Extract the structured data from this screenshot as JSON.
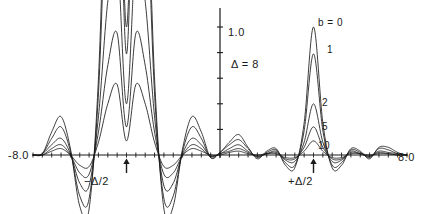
{
  "figure": {
    "background": "#ffffff",
    "line_color": "#1a1a1a",
    "axis_color": "#1a1a1a"
  },
  "annotations": {
    "delta_label": "Δ = 8",
    "neg_half_label": "−Δ/2",
    "pos_half_label": "+Δ/2",
    "y_tick_label": "1.0",
    "x_min_label": "-8.0",
    "x_max_label": "8.0"
  },
  "curve_labels": {
    "b0": "b = 0",
    "b1": "1",
    "b2": "2",
    "b5": "5",
    "b10": "10"
  },
  "chart_data": {
    "type": "line",
    "title": "",
    "subtitle": "",
    "xlabel": "",
    "ylabel": "",
    "xlim": [
      -8.0,
      8.0
    ],
    "ylim": [
      -0.45,
      1.25
    ],
    "grid": false,
    "legend": "inline-curve-labels",
    "legend_position": "on-curves-near-right-peak",
    "axes": {
      "x_axis_at_y": 0.0,
      "y_axis_at_x": 0.0,
      "x_tick_interval": 0.4,
      "y_tick_interval": 0.2,
      "x_tick_labels": [
        "-8.0",
        "8.0"
      ],
      "y_tick_labels": [
        "1.0"
      ],
      "y_label_value": 1.0
    },
    "parameters": {
      "delta": 8,
      "peak_centers": [
        -4.0,
        4.0
      ],
      "parameter_name": "b",
      "parameter_values": [
        0,
        1,
        2,
        5,
        10
      ]
    },
    "series": [
      {
        "name": "b = 0",
        "b": 0,
        "peak_right_height": 1.0,
        "peak_left_height": 3.2,
        "clipped_top": true,
        "x": [
          -8.0,
          -7.6,
          -7.2,
          -6.8,
          -6.4,
          -6.0,
          -5.6,
          -5.2,
          -4.8,
          -4.4,
          -4.0,
          -3.6,
          -3.2,
          -2.8,
          -2.4,
          -2.0,
          -1.6,
          -1.2,
          -0.8,
          -0.4,
          0.0,
          0.4,
          0.8,
          1.2,
          1.6,
          2.0,
          2.4,
          2.8,
          3.2,
          3.6,
          4.0,
          4.4,
          4.8,
          5.2,
          5.6,
          6.0,
          6.4,
          6.8,
          7.2,
          7.6,
          8.0
        ],
        "y": [
          0.0,
          0.01,
          0.18,
          0.3,
          0.05,
          -0.4,
          -0.42,
          0.6,
          2.6,
          3.1,
          1.0,
          3.1,
          2.6,
          0.6,
          -0.42,
          -0.4,
          0.05,
          0.3,
          0.18,
          -0.02,
          0.02,
          0.1,
          0.16,
          0.06,
          -0.03,
          0.03,
          0.05,
          -0.08,
          -0.1,
          0.25,
          1.0,
          0.25,
          -0.1,
          -0.08,
          0.05,
          0.03,
          -0.03,
          0.06,
          0.06,
          0.02,
          0.0
        ]
      },
      {
        "name": "1",
        "b": 1,
        "peak_right_height": 0.79,
        "peak_left_height": 2.8,
        "clipped_top": true,
        "x": [
          -8.0,
          -7.6,
          -7.2,
          -6.8,
          -6.4,
          -6.0,
          -5.6,
          -5.2,
          -4.8,
          -4.4,
          -4.0,
          -3.6,
          -3.2,
          -2.8,
          -2.4,
          -2.0,
          -1.6,
          -1.2,
          -0.8,
          -0.4,
          0.0,
          0.4,
          0.8,
          1.2,
          1.6,
          2.0,
          2.4,
          2.8,
          3.2,
          3.6,
          4.0,
          4.4,
          4.8,
          5.2,
          5.6,
          6.0,
          6.4,
          6.8,
          7.2,
          7.6,
          8.0
        ],
        "y": [
          0.0,
          0.01,
          0.13,
          0.22,
          0.03,
          -0.32,
          -0.34,
          0.48,
          2.3,
          2.8,
          0.79,
          2.8,
          2.3,
          0.48,
          -0.34,
          -0.32,
          0.03,
          0.22,
          0.13,
          -0.02,
          0.02,
          0.08,
          0.12,
          0.05,
          -0.02,
          0.02,
          0.04,
          -0.06,
          -0.08,
          0.19,
          0.79,
          0.19,
          -0.08,
          -0.06,
          0.04,
          0.02,
          -0.02,
          0.05,
          0.04,
          0.01,
          0.0
        ]
      },
      {
        "name": "2",
        "b": 2,
        "peak_right_height": 0.4,
        "peak_left_height": 1.55,
        "clipped_top": false,
        "x": [
          -8.0,
          -7.6,
          -7.2,
          -6.8,
          -6.4,
          -6.0,
          -5.6,
          -5.2,
          -4.8,
          -4.4,
          -4.0,
          -3.6,
          -3.2,
          -2.8,
          -2.4,
          -2.0,
          -1.6,
          -1.2,
          -0.8,
          -0.4,
          0.0,
          0.4,
          0.8,
          1.2,
          1.6,
          2.0,
          2.4,
          2.8,
          3.2,
          3.6,
          4.0,
          4.4,
          4.8,
          5.2,
          5.6,
          6.0,
          6.4,
          6.8,
          7.2,
          7.6,
          8.0
        ],
        "y": [
          0.0,
          0.01,
          0.08,
          0.13,
          0.01,
          -0.22,
          -0.24,
          0.3,
          1.2,
          1.55,
          0.4,
          1.55,
          1.2,
          0.3,
          -0.24,
          -0.22,
          0.01,
          0.13,
          0.08,
          -0.01,
          0.01,
          0.05,
          0.08,
          0.03,
          -0.01,
          0.01,
          0.03,
          -0.04,
          -0.05,
          0.1,
          0.4,
          0.1,
          -0.05,
          -0.04,
          0.03,
          0.01,
          -0.01,
          0.03,
          0.02,
          0.01,
          0.0
        ]
      },
      {
        "name": "5",
        "b": 5,
        "peak_right_height": 0.22,
        "peak_left_height": 0.95,
        "clipped_top": false,
        "x": [
          -8.0,
          -7.6,
          -7.2,
          -6.8,
          -6.4,
          -6.0,
          -5.6,
          -5.2,
          -4.8,
          -4.4,
          -4.0,
          -3.6,
          -3.2,
          -2.8,
          -2.4,
          -2.0,
          -1.6,
          -1.2,
          -0.8,
          -0.4,
          0.0,
          0.4,
          0.8,
          1.2,
          1.6,
          2.0,
          2.4,
          2.8,
          3.2,
          3.6,
          4.0,
          4.4,
          4.8,
          5.2,
          5.6,
          6.0,
          6.4,
          6.8,
          7.2,
          7.6,
          8.0
        ],
        "y": [
          0.0,
          0.0,
          0.05,
          0.08,
          0.0,
          -0.14,
          -0.15,
          0.18,
          0.7,
          0.95,
          0.22,
          0.95,
          0.7,
          0.18,
          -0.15,
          -0.14,
          0.0,
          0.08,
          0.05,
          -0.01,
          0.01,
          0.03,
          0.05,
          0.02,
          -0.01,
          0.01,
          0.02,
          -0.03,
          -0.03,
          0.06,
          0.22,
          0.06,
          -0.03,
          -0.03,
          0.02,
          0.01,
          -0.01,
          0.02,
          0.01,
          0.0,
          0.0
        ]
      },
      {
        "name": "10",
        "b": 10,
        "peak_right_height": 0.11,
        "peak_left_height": 0.55,
        "clipped_top": false,
        "x": [
          -8.0,
          -7.6,
          -7.2,
          -6.8,
          -6.4,
          -6.0,
          -5.6,
          -5.2,
          -4.8,
          -4.4,
          -4.0,
          -3.6,
          -3.2,
          -2.8,
          -2.4,
          -2.0,
          -1.6,
          -1.2,
          -0.8,
          -0.4,
          0.0,
          0.4,
          0.8,
          1.2,
          1.6,
          2.0,
          2.4,
          2.8,
          3.2,
          3.6,
          4.0,
          4.4,
          4.8,
          5.2,
          5.6,
          6.0,
          6.4,
          6.8,
          7.2,
          7.6,
          8.0
        ],
        "y": [
          0.0,
          0.0,
          0.03,
          0.05,
          0.0,
          -0.08,
          -0.09,
          0.1,
          0.4,
          0.55,
          0.11,
          0.55,
          0.4,
          0.1,
          -0.09,
          -0.08,
          0.0,
          0.05,
          0.03,
          0.0,
          0.0,
          0.02,
          0.03,
          0.01,
          0.0,
          0.01,
          0.01,
          -0.02,
          -0.02,
          0.03,
          0.11,
          0.03,
          -0.02,
          -0.02,
          0.01,
          0.01,
          0.0,
          0.01,
          0.01,
          0.0,
          0.0
        ]
      }
    ]
  }
}
